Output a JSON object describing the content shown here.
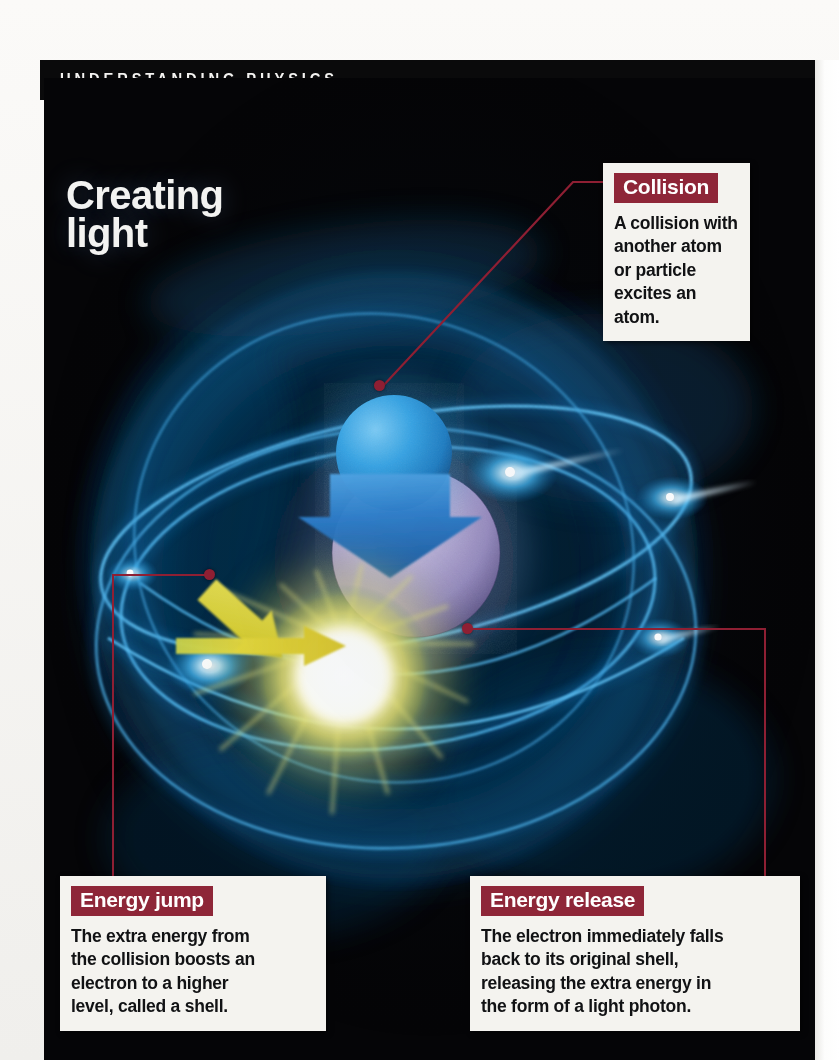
{
  "header": {
    "kicker": "UNDERSTANDING PHYSICS"
  },
  "headline": {
    "text": "Creating\nlight"
  },
  "colors": {
    "plate_background": "#060607",
    "callout_header": "#8e2638",
    "leader_line": "#8e1f33",
    "callout_paper": "#f4f3ef",
    "orbit_blue": "#2aa3e8",
    "nucleus_violet": "#b3a9d4",
    "photon_yellow": "#f6f0a8",
    "arrow_yellow": "#e3d33a",
    "arrow_blue": "#2a6fc4"
  },
  "callouts": [
    {
      "id": "collision",
      "title": "Collision",
      "body": "A collision with\nanother atom\nor particle\nexcites an atom."
    },
    {
      "id": "energy-jump",
      "title": "Energy jump",
      "body": "The extra energy from\nthe collision boosts an\nelectron to a higher\nlevel, called a shell."
    },
    {
      "id": "energy-release",
      "title": "Energy release",
      "body": "The electron immediately falls\nback to its original shell,\nreleasing the extra energy in\nthe form of a light photon."
    }
  ],
  "illustration": {
    "description": "Atom diagram on black: violet nucleus at centre, glowing blue elliptical electron shells, a blue particle approaching from upper left with a blue arrow, yellow arrows showing an electron jumping to a higher shell and returning, and a bright yellow-white photon burst at lower right.",
    "elements": [
      {
        "name": "incoming-particle",
        "label": "blue particle sphere"
      },
      {
        "name": "collision-arrow",
        "label": "blue down arrow"
      },
      {
        "name": "nucleus",
        "label": "violet nucleus"
      },
      {
        "name": "electron-shell-outer",
        "label": "outer orbital shell"
      },
      {
        "name": "electron-shell-inner",
        "label": "inner orbital shell"
      },
      {
        "name": "energy-jump-arrow",
        "label": "yellow diagonal arrow"
      },
      {
        "name": "energy-return-arrow",
        "label": "yellow horizontal arrow"
      },
      {
        "name": "photon-burst",
        "label": "light photon flash"
      }
    ]
  }
}
